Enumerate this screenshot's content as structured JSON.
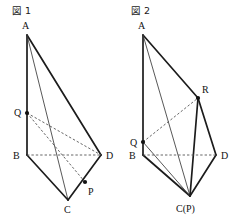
{
  "page": {
    "background_color": "#ffffff",
    "ink_color": "#1c1c1c",
    "dashed_color": "#555555",
    "width": 237,
    "height": 217
  },
  "figures": [
    {
      "id": "figure-1",
      "caption": "図 1",
      "caption_pos": {
        "x": 12,
        "y": 14
      },
      "vertices": [
        {
          "name": "A",
          "label": "A",
          "x": 27,
          "y": 35,
          "dot": false,
          "label_x": 22,
          "label_y": 29
        },
        {
          "name": "B",
          "label": "B",
          "x": 27,
          "y": 155,
          "dot": false,
          "label_x": 13,
          "label_y": 159
        },
        {
          "name": "C",
          "label": "C",
          "x": 68,
          "y": 200,
          "dot": false,
          "label_x": 64,
          "label_y": 213
        },
        {
          "name": "D",
          "label": "D",
          "x": 101,
          "y": 155,
          "dot": false,
          "label_x": 106,
          "label_y": 159
        },
        {
          "name": "Q",
          "label": "Q",
          "x": 27,
          "y": 113,
          "dot": true,
          "label_x": 14,
          "label_y": 116
        },
        {
          "name": "P",
          "label": "P",
          "x": 85,
          "y": 182,
          "dot": true,
          "label_x": 88,
          "label_y": 195
        }
      ],
      "edges": [
        {
          "from": "A",
          "to": "B",
          "style": "solid"
        },
        {
          "from": "A",
          "to": "D",
          "style": "solid"
        },
        {
          "from": "A",
          "to": "C",
          "style": "thin"
        },
        {
          "from": "B",
          "to": "C",
          "style": "solid"
        },
        {
          "from": "C",
          "to": "D",
          "style": "solid"
        },
        {
          "from": "B",
          "to": "D",
          "style": "dashed"
        },
        {
          "from": "Q",
          "to": "P",
          "style": "dashed"
        },
        {
          "from": "Q",
          "to": "D",
          "style": "dashed"
        }
      ]
    },
    {
      "id": "figure-2",
      "caption": "図 2",
      "caption_pos": {
        "x": 131,
        "y": 14
      },
      "vertices": [
        {
          "name": "A",
          "label": "A",
          "x": 143,
          "y": 35,
          "dot": false,
          "label_x": 138,
          "label_y": 29
        },
        {
          "name": "B",
          "label": "B",
          "x": 143,
          "y": 155,
          "dot": false,
          "label_x": 129,
          "label_y": 159
        },
        {
          "name": "CP",
          "label": "C(P)",
          "x": 190,
          "y": 196,
          "dot": false,
          "label_x": 176,
          "label_y": 212
        },
        {
          "name": "D",
          "label": "D",
          "x": 216,
          "y": 155,
          "dot": false,
          "label_x": 221,
          "label_y": 159
        },
        {
          "name": "Q",
          "label": "Q",
          "x": 143,
          "y": 142,
          "dot": true,
          "label_x": 130,
          "label_y": 146
        },
        {
          "name": "R",
          "label": "R",
          "x": 198,
          "y": 98,
          "dot": true,
          "label_x": 202,
          "label_y": 93
        }
      ],
      "edges": [
        {
          "from": "A",
          "to": "B",
          "style": "solid"
        },
        {
          "from": "A",
          "to": "R",
          "style": "solid"
        },
        {
          "from": "R",
          "to": "D",
          "style": "solid"
        },
        {
          "from": "A",
          "to": "CP",
          "style": "thin"
        },
        {
          "from": "R",
          "to": "CP",
          "style": "solid"
        },
        {
          "from": "B",
          "to": "CP",
          "style": "solid"
        },
        {
          "from": "Q",
          "to": "CP",
          "style": "thin"
        },
        {
          "from": "CP",
          "to": "D",
          "style": "solid"
        },
        {
          "from": "B",
          "to": "D",
          "style": "dashed"
        },
        {
          "from": "Q",
          "to": "R",
          "style": "dashed"
        }
      ]
    }
  ]
}
